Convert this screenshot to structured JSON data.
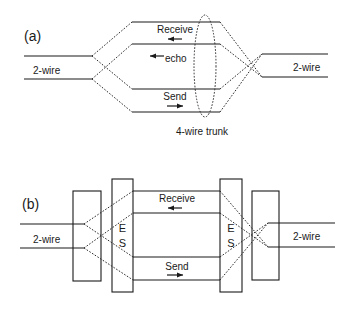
{
  "panel_a": {
    "label": "(a)",
    "left_label": "2-wire",
    "right_label": "2-wire",
    "receive_label": "Receive",
    "echo_label": "echo",
    "send_label": "Send",
    "trunk_label": "4-wire trunk"
  },
  "panel_b": {
    "label": "(b)",
    "left_label": "2-wire",
    "right_label": "2-wire",
    "receive_label": "Receive",
    "send_label": "Send",
    "echo_suppressor_left": [
      "E",
      "S"
    ],
    "echo_suppressor_right": [
      "E",
      "S"
    ]
  },
  "colors": {
    "line": "#1a1a1a",
    "background": "#ffffff"
  }
}
